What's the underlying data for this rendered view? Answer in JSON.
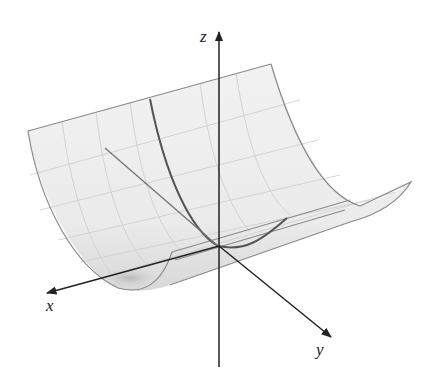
{
  "figure": {
    "axes": {
      "x": {
        "label": "x"
      },
      "y": {
        "label": "y"
      },
      "z": {
        "label": "z"
      }
    },
    "colors": {
      "surface_fill": "#ededed",
      "surface_edge": "#8a8a8a",
      "grid": "#c8c8c8",
      "highlight_curve": "#555555",
      "axis": "#222222"
    }
  }
}
